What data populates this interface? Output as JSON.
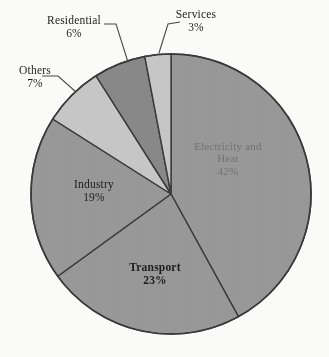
{
  "chart_data": {
    "type": "pie",
    "title": "",
    "subtitle": "",
    "xlabel": "",
    "ylabel": "",
    "legend_position": "none",
    "grid": false,
    "units": "percent",
    "total": 100,
    "start_angle_deg": 0,
    "direction": "clockwise",
    "categories": [
      "Electricity and Heat",
      "Transport",
      "Industry",
      "Others",
      "Residential",
      "Services"
    ],
    "values": [
      42,
      23,
      19,
      7,
      6,
      3
    ],
    "slices": [
      {
        "label": "Electricity and Heat",
        "name_line1": "Electricity and",
        "name_line2": "Heat",
        "value": 42,
        "value_text": "42%",
        "color": "#9a9a9a",
        "label_placement": "inside",
        "label_style": "faint"
      },
      {
        "label": "Transport",
        "value": 23,
        "value_text": "23%",
        "color": "#9a9a9a",
        "label_placement": "inside",
        "label_style": "bold"
      },
      {
        "label": "Industry",
        "value": 19,
        "value_text": "19%",
        "color": "#9a9a9a",
        "label_placement": "inside",
        "label_style": "normal"
      },
      {
        "label": "Others",
        "value": 7,
        "value_text": "7%",
        "color": "#c9c9c9",
        "label_placement": "callout",
        "label_style": "normal"
      },
      {
        "label": "Residential",
        "value": 6,
        "value_text": "6%",
        "color": "#8a8a8a",
        "label_placement": "callout",
        "label_style": "normal"
      },
      {
        "label": "Services",
        "value": 3,
        "value_text": "3%",
        "color": "#c9c9c9",
        "label_placement": "callout",
        "label_style": "normal"
      }
    ],
    "colors": {
      "background": "#fdfdfc",
      "slice_medium_gray": "#9a9a9a",
      "slice_dark_gray": "#8a8a8a",
      "slice_light_gray": "#c9c9c9",
      "outline": "#3a3a3a",
      "label_text": "#1d1d1d",
      "faint_label_text": "#6f6f6f",
      "leader_line": "#4a4a4a"
    },
    "geometry": {
      "center_x": 171,
      "center_y": 194,
      "radius": 140
    }
  }
}
